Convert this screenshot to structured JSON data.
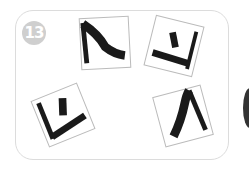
{
  "puzzle": {
    "number_label": "13",
    "cards": [
      {
        "id": "top-left",
        "rotation_deg": -3,
        "glyph": "corner-stroke-top-left"
      },
      {
        "id": "top-right",
        "rotation_deg": 15,
        "glyph": "bar-and-corner"
      },
      {
        "id": "bottom-left",
        "rotation_deg": -22,
        "glyph": "bar-and-corner"
      },
      {
        "id": "bottom-right",
        "rotation_deg": -15,
        "glyph": "caret-stroke"
      }
    ]
  },
  "colors": {
    "stroke": "#1a1a1a",
    "card_border": "#bbbbbb",
    "panel_border": "#dcdcdc",
    "badge_bg": "#cfcfcf"
  }
}
